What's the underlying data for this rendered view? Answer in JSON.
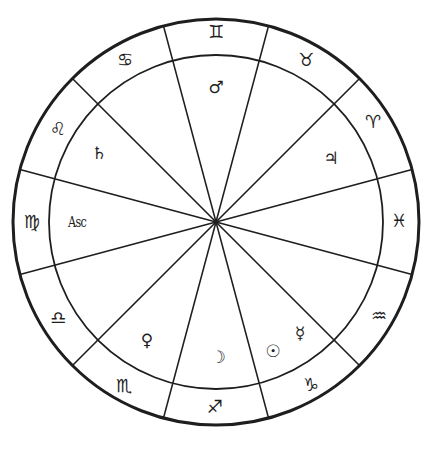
{
  "chart": {
    "type": "astrological-natal-wheel",
    "center": {
      "x": 216,
      "y": 222
    },
    "outer_radius": 203,
    "inner_radius": 167,
    "stroke_color": "#1e1e1e",
    "divider_angles_deg": [
      15,
      45,
      75,
      105,
      135,
      165
    ]
  },
  "signs": [
    {
      "name": "Gemini",
      "glyph": "♊",
      "x": 216,
      "y": 32
    },
    {
      "name": "Taurus",
      "glyph": "♉",
      "x": 306,
      "y": 60
    },
    {
      "name": "Aries",
      "glyph": "♈",
      "x": 373,
      "y": 122
    },
    {
      "name": "Pisces",
      "glyph": "♓",
      "x": 399,
      "y": 221
    },
    {
      "name": "Aquarius",
      "glyph": "♒",
      "x": 379,
      "y": 316
    },
    {
      "name": "Capricorn",
      "glyph": "♑",
      "x": 311,
      "y": 385
    },
    {
      "name": "Sagittarius",
      "glyph": "♐",
      "x": 215,
      "y": 407
    },
    {
      "name": "Scorpio",
      "glyph": "♏",
      "x": 124,
      "y": 386
    },
    {
      "name": "Libra",
      "glyph": "♎",
      "x": 58,
      "y": 318
    },
    {
      "name": "Virgo",
      "glyph": "♍",
      "x": 32,
      "y": 222
    },
    {
      "name": "Leo",
      "glyph": "♌",
      "x": 58,
      "y": 129
    },
    {
      "name": "Cancer",
      "glyph": "♋",
      "x": 125,
      "y": 60
    }
  ],
  "planets": [
    {
      "name": "Mars",
      "glyph": "♂",
      "x": 216,
      "y": 87
    },
    {
      "name": "Jupiter",
      "glyph": "♃",
      "x": 331,
      "y": 158
    },
    {
      "name": "Saturn",
      "glyph": "♄",
      "x": 99,
      "y": 153
    },
    {
      "name": "Venus",
      "glyph": "♀",
      "x": 147,
      "y": 340
    },
    {
      "name": "Moon",
      "glyph": "☽",
      "x": 218,
      "y": 357
    },
    {
      "name": "Sun",
      "glyph": "☉",
      "x": 273,
      "y": 351
    },
    {
      "name": "Mercury",
      "glyph": "☿",
      "x": 300,
      "y": 333
    }
  ],
  "ascendant": {
    "label": "Asc",
    "x": 77,
    "y": 222
  }
}
